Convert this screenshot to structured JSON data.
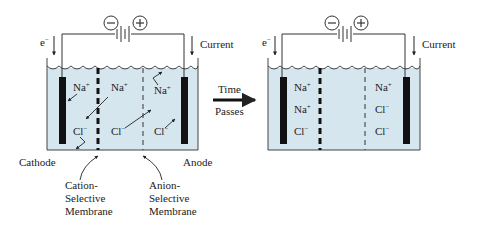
{
  "colors": {
    "water": "#d6e6ee",
    "ink": "#222222",
    "electrode": "#111111"
  },
  "left_cell": {
    "electron_label": "e",
    "electron_sup": "−",
    "current_label": "Current",
    "battery_neg": "−",
    "battery_pos": "+",
    "ions": [
      {
        "id": "na1",
        "base": "Na",
        "sup": "+"
      },
      {
        "id": "na2",
        "base": "Na",
        "sup": "+"
      },
      {
        "id": "na3",
        "base": "Na",
        "sup": "+"
      },
      {
        "id": "cl1",
        "base": "Cl",
        "sup": "−"
      },
      {
        "id": "cl2",
        "base": "Cl",
        "sup": "−"
      },
      {
        "id": "cl3",
        "base": "Cl",
        "sup": "−"
      }
    ],
    "cathode_label": "Cathode",
    "anode_label": "Anode",
    "cation_membrane_label": [
      "Cation-",
      "Selective",
      "Membrane"
    ],
    "anion_membrane_label": [
      "Anion-",
      "Selective",
      "Membrane"
    ]
  },
  "transition": {
    "top_label": "Time",
    "bottom_label": "Passes"
  },
  "right_cell": {
    "electron_label": "e",
    "electron_sup": "−",
    "current_label": "Current",
    "battery_neg": "−",
    "battery_pos": "+",
    "left_ions": [
      {
        "base": "Na",
        "sup": "+"
      },
      {
        "base": "Na",
        "sup": "+"
      },
      {
        "base": "Cl",
        "sup": "−"
      }
    ],
    "right_ions": [
      {
        "base": "Na",
        "sup": "+"
      },
      {
        "base": "Cl",
        "sup": "−"
      },
      {
        "base": "Cl",
        "sup": "−"
      }
    ]
  }
}
